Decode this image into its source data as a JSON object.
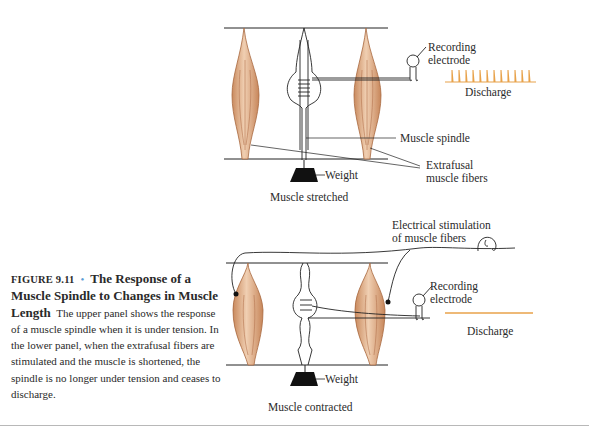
{
  "figure": {
    "upper_panel": {
      "labels": {
        "recording_electrode_line1": "Recording",
        "recording_electrode_line2": "electrode",
        "discharge": "Discharge",
        "muscle_spindle": "Muscle spindle",
        "extrafusal_line1": "Extrafusal",
        "extrafusal_line2": "muscle fibers",
        "weight": "Weight",
        "panel_title": "Muscle stretched"
      },
      "discharge_spikes": 13
    },
    "lower_panel": {
      "labels": {
        "stimulation_line1": "Electrical stimulation",
        "stimulation_line2": "of muscle fibers",
        "recording_electrode_line1": "Recording",
        "recording_electrode_line2": "electrode",
        "discharge": "Discharge",
        "weight": "Weight",
        "panel_title": "Muscle contracted"
      },
      "discharge_spikes": 0
    },
    "colors": {
      "discharge_trace": "#e8a24a",
      "muscle_fill": "#e2b08a",
      "caption_dot": "#5b9bd5"
    }
  },
  "caption": {
    "figure_number": "FIGURE 9.11",
    "bullet": "•",
    "title": "The Response of a Muscle Spindle to Changes in Muscle Length",
    "body": "The upper panel shows the response of a muscle spindle when it is under tension. In the lower panel, when the extrafusal fibers are stimulated and the muscle is shortened, the spindle is no longer under tension and ceases to discharge."
  }
}
